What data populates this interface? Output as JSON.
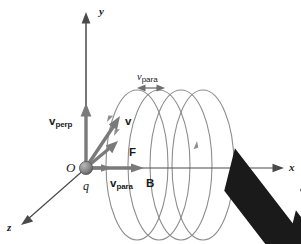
{
  "figure": {
    "background_color": "#ffffff",
    "axis_color": "#3c3c3c",
    "helix_color": "#8a8a8a",
    "vector_color": "#6e6e6e",
    "label_color": "#1a1a1a",
    "charge_color": "#808080"
  },
  "axes": [
    {
      "id": "y-axis",
      "label": "y",
      "direction": "up"
    },
    {
      "id": "x-axis",
      "label": "x",
      "direction": "right"
    },
    {
      "id": "z-axis",
      "label": "z",
      "direction": "down-left"
    }
  ],
  "origin": {
    "point_label": "O",
    "charge_label": "q",
    "marker": "charge-sphere"
  },
  "vectors": [
    {
      "id": "v-perp",
      "symbol": "v",
      "subscript": "perp",
      "bold": true,
      "has_arrow_overbar": true,
      "label_x": 49,
      "label_y": 116,
      "description": "velocity component perpendicular to B, along +y"
    },
    {
      "id": "v-total",
      "symbol": "v",
      "subscript": "",
      "bold": true,
      "has_arrow_overbar": true,
      "label_x": 125,
      "label_y": 116,
      "description": "total velocity vector, diagonal up-right"
    },
    {
      "id": "force",
      "symbol": "F",
      "subscript": "",
      "bold": true,
      "has_arrow_overbar": true,
      "label_x": 129,
      "label_y": 147,
      "description": "magnetic force on the charge"
    },
    {
      "id": "v-para",
      "symbol": "v",
      "subscript": "para",
      "bold": true,
      "has_arrow_overbar": true,
      "label_x": 110,
      "label_y": 179,
      "description": "velocity component parallel to B, along +x"
    },
    {
      "id": "b-field",
      "symbol": "B",
      "subscript": "",
      "bold": true,
      "has_arrow_overbar": true,
      "label_x": 146,
      "label_y": 179,
      "description": "magnetic field vector along +x"
    }
  ],
  "annotations": [
    {
      "id": "pitch",
      "symbol": "v",
      "subscript": "para",
      "bold": false,
      "has_arrow_overbar": false,
      "label_x": 140,
      "label_y": 76,
      "marker": "double-headed-arrow",
      "description": "pitch of the helix set by the parallel velocity"
    }
  ],
  "helix": {
    "loops": 4,
    "direction_markers": 3,
    "description": "helical trajectory of the charged particle around the x-axis"
  }
}
